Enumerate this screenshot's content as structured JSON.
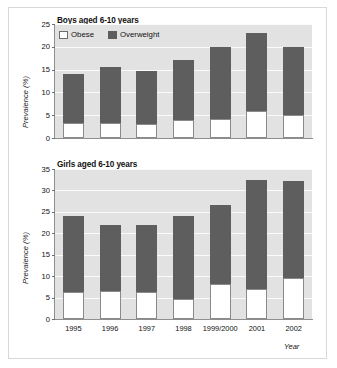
{
  "chart_data": [
    {
      "type": "bar",
      "title": "Boys aged 6-10 years",
      "xlabel": "",
      "ylabel": "Prevalence (%)",
      "categories": [
        "1995",
        "1996",
        "1997",
        "1998",
        "1999/2000",
        "2001",
        "2002"
      ],
      "ylim": [
        0,
        25
      ],
      "yticks": [
        0,
        5,
        10,
        15,
        20,
        25
      ],
      "grid": true,
      "stacked": true,
      "legend_position": "top-left",
      "series": [
        {
          "name": "Obese",
          "color": "#ffffff",
          "values": [
            3.3,
            3.4,
            3.1,
            3.9,
            4.2,
            5.9,
            5.1
          ]
        },
        {
          "name": "Overweight",
          "color": "#5e5e5e",
          "values": [
            10.7,
            12.2,
            11.7,
            13.1,
            15.8,
            17.1,
            14.8
          ]
        }
      ],
      "totals": [
        14.0,
        15.6,
        14.8,
        17.0,
        20.0,
        23.0,
        19.9
      ]
    },
    {
      "type": "bar",
      "title": "Girls aged 6-10 years",
      "xlabel": "Year",
      "ylabel": "Prevalence (%)",
      "categories": [
        "1995",
        "1996",
        "1997",
        "1998",
        "1999/2000",
        "2001",
        "2002"
      ],
      "ylim": [
        0,
        35
      ],
      "yticks": [
        0,
        5,
        10,
        15,
        20,
        25,
        30,
        35
      ],
      "grid": true,
      "stacked": true,
      "legend_position": "none",
      "series": [
        {
          "name": "Obese",
          "color": "#ffffff",
          "values": [
            6.3,
            6.5,
            6.4,
            4.7,
            8.2,
            6.9,
            9.5
          ]
        },
        {
          "name": "Overweight",
          "color": "#5e5e5e",
          "values": [
            17.8,
            15.5,
            15.5,
            19.4,
            18.5,
            25.5,
            22.8
          ]
        }
      ],
      "totals": [
        24.1,
        22.0,
        21.9,
        24.1,
        26.7,
        32.4,
        32.3
      ]
    }
  ],
  "legend": {
    "items": [
      {
        "label": "Obese",
        "swatch": "obese-swatch"
      },
      {
        "label": "Overweight",
        "swatch": "overweight-swatch"
      }
    ]
  },
  "colors": {
    "overweight": "#5e5e5e",
    "obese": "#ffffff",
    "plot_background": "#e2e2e2",
    "gridline": "#fbfbfb",
    "axis": "#8f8f8f"
  }
}
